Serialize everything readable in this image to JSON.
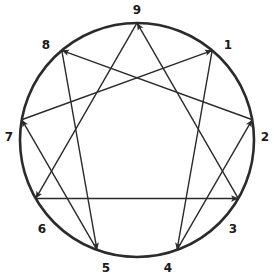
{
  "figure": {
    "name": "Enneagram",
    "type": "diagram",
    "background_color": "#ffffff",
    "stroke_color": "#2b2b2b",
    "label_color": "#1a1a1a",
    "circle": {
      "cx": 137,
      "cy": 140,
      "r": 117,
      "stroke_width": 2.6
    },
    "line_stroke_width": 1.4
  },
  "nodes": [
    {
      "id": "1",
      "label": "1",
      "angle_deg": -50,
      "x": 212.2,
      "y": 50.4,
      "label_x": 228,
      "label_y": 45
    },
    {
      "id": "2",
      "label": "2",
      "angle_deg": -10,
      "x": 252.2,
      "y": 119.7,
      "label_x": 265,
      "label_y": 137
    },
    {
      "id": "3",
      "label": "3",
      "angle_deg": 30,
      "x": 238.3,
      "y": 198.5,
      "label_x": 233,
      "label_y": 229
    },
    {
      "id": "4",
      "label": "4",
      "angle_deg": 70,
      "x": 177.0,
      "y": 249.9,
      "label_x": 168,
      "label_y": 268
    },
    {
      "id": "5",
      "label": "5",
      "angle_deg": 110,
      "x": 97.0,
      "y": 249.9,
      "label_x": 106,
      "label_y": 268
    },
    {
      "id": "6",
      "label": "6",
      "angle_deg": 150,
      "x": 35.7,
      "y": 198.5,
      "label_x": 42,
      "label_y": 229
    },
    {
      "id": "7",
      "label": "7",
      "angle_deg": 190,
      "x": 21.8,
      "y": 119.7,
      "label_x": 9,
      "label_y": 137
    },
    {
      "id": "8",
      "label": "8",
      "angle_deg": 230,
      "x": 61.8,
      "y": 50.4,
      "label_x": 46,
      "label_y": 45
    },
    {
      "id": "9",
      "label": "9",
      "angle_deg": 270,
      "x": 137.0,
      "y": 23.0,
      "label_x": 137,
      "label_y": 10
    }
  ],
  "connections": {
    "triangle": {
      "name": "3-6-9 triangle",
      "sequence": [
        "9",
        "6",
        "3",
        "9"
      ],
      "edges": [
        {
          "from": "9",
          "to": "6",
          "arrow": "to"
        },
        {
          "from": "6",
          "to": "3",
          "arrow": "to"
        },
        {
          "from": "3",
          "to": "9",
          "arrow": "to"
        }
      ]
    },
    "hexad": {
      "name": "1-4-2-8-5-7 hexad",
      "sequence": [
        "1",
        "4",
        "2",
        "8",
        "5",
        "7",
        "1"
      ],
      "edges": [
        {
          "from": "1",
          "to": "4",
          "arrow": "to"
        },
        {
          "from": "4",
          "to": "2",
          "arrow": "to"
        },
        {
          "from": "2",
          "to": "8",
          "arrow": "to"
        },
        {
          "from": "8",
          "to": "5",
          "arrow": "to"
        },
        {
          "from": "5",
          "to": "7",
          "arrow": "to"
        },
        {
          "from": "7",
          "to": "1",
          "arrow": "to"
        }
      ]
    }
  }
}
